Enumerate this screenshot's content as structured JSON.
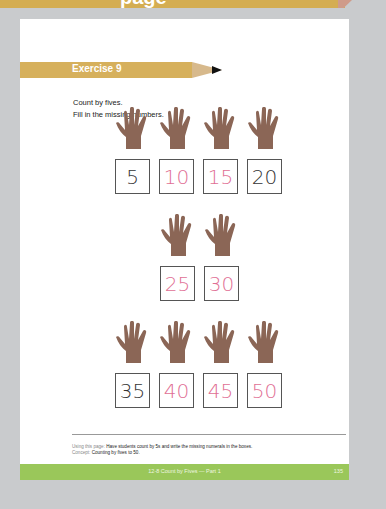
{
  "top_banner": {
    "text_fragment": "page",
    "color": "#d4ad52"
  },
  "exercise": {
    "title": "Exercise 9",
    "banner_color": "#d6b05c",
    "instructions": [
      "Count by fives.",
      "Fill in the missing numbers."
    ]
  },
  "rows": [
    {
      "cells": [
        {
          "value": "5",
          "style": "given"
        },
        {
          "value": "10",
          "style": "traced"
        },
        {
          "value": "15",
          "style": "traced"
        },
        {
          "value": "20",
          "style": "given"
        }
      ]
    },
    {
      "cells": [
        {
          "value": "25",
          "style": "traced"
        },
        {
          "value": "30",
          "style": "traced"
        }
      ]
    },
    {
      "cells": [
        {
          "value": "35",
          "style": "given"
        },
        {
          "value": "40",
          "style": "traced"
        },
        {
          "value": "45",
          "style": "traced"
        },
        {
          "value": "50",
          "style": "traced"
        }
      ]
    }
  ],
  "colors": {
    "hand": "#8b6656",
    "traced_digit": "#df6f95",
    "given_digit": "#333333",
    "footer": "#9ac75a"
  },
  "note": {
    "using_label": "Using this page:",
    "using_text": "Have students count by 5s and write the missing numerals in the boxes.",
    "concept_label": "Concept:",
    "concept_text": "Counting by fives to 50."
  },
  "footer": {
    "title": "12-8 Count by Fives — Part 1",
    "page_number": "135"
  }
}
